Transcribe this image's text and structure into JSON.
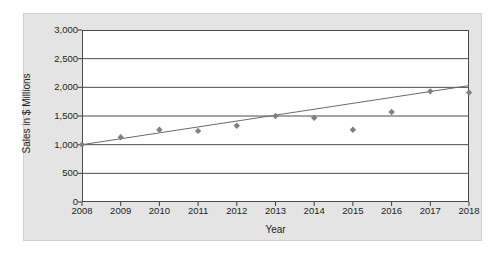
{
  "chart_data": {
    "type": "scatter",
    "title": "",
    "subtitle": "",
    "xlabel": "Year",
    "ylabel": "Sales in $ Millions",
    "x": [
      2008,
      2009,
      2010,
      2011,
      2012,
      2013,
      2014,
      2015,
      2016,
      2017,
      2018
    ],
    "values": [
      1000,
      1130,
      1260,
      1240,
      1330,
      1500,
      1470,
      1260,
      1570,
      1930,
      1910
    ],
    "categories": [
      "2008",
      "2009",
      "2010",
      "2011",
      "2012",
      "2013",
      "2014",
      "2015",
      "2016",
      "2017",
      "2018"
    ],
    "xtick_labels": [
      "2008",
      "2009",
      "2010",
      "2011",
      "2012",
      "2013",
      "2014",
      "2015",
      "2016",
      "2017",
      "2018"
    ],
    "ytick_labels": [
      "0",
      "500",
      "1,000",
      "1,500",
      "2,000",
      "2,500",
      "3,000"
    ],
    "ytick_values": [
      0,
      500,
      1000,
      1500,
      2000,
      2500,
      3000
    ],
    "xlim": [
      2008,
      2018
    ],
    "ylim": [
      0,
      3000
    ],
    "grid": "horizontal",
    "legend": "none",
    "series": [
      {
        "name": "Sales",
        "type": "scatter",
        "marker": "diamond",
        "color": "#808080",
        "values": [
          1000,
          1130,
          1260,
          1240,
          1330,
          1500,
          1470,
          1260,
          1570,
          1930,
          1910
        ]
      },
      {
        "name": "Trendline",
        "type": "line",
        "color": "#6b6b6b",
        "endpoints": [
          [
            2008,
            1000
          ],
          [
            2018,
            2030
          ]
        ]
      }
    ],
    "colors": {
      "marker": "#808080",
      "trendline": "#6b6b6b",
      "gridline": "#4a4a4a",
      "axis": "#3c3c3c",
      "plot_background": "#ffffff",
      "panel_background": "#e4e4e4",
      "text": "#231f20"
    }
  }
}
